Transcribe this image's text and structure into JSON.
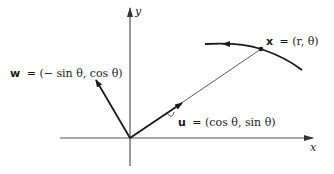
{
  "diagram": {
    "axes": {
      "x_label": "x",
      "y_label": "y"
    },
    "vectors": {
      "w": {
        "name": "w",
        "formula": "= (− sin θ, cos θ)"
      },
      "u": {
        "name": "u",
        "formula": "= (cos θ, sin θ)"
      }
    },
    "point": {
      "name": "x",
      "formula": "= (r, θ)"
    },
    "colors": {
      "ink": "#1a1a1a",
      "axis": "#555555"
    }
  }
}
